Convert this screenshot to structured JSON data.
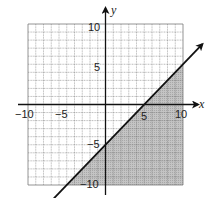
{
  "chart_data": {
    "type": "line",
    "title": "",
    "xlabel": "x",
    "ylabel": "y",
    "xlim": [
      -10,
      10
    ],
    "ylim": [
      -10,
      10
    ],
    "grid": true,
    "grid_step": 1,
    "x_tick_labels": [
      "-10",
      "-5",
      "5",
      "10"
    ],
    "x_ticks": [
      -10,
      -5,
      5,
      10
    ],
    "y_tick_labels": [
      "10",
      "5",
      "-5",
      "-10"
    ],
    "y_ticks": [
      10,
      5,
      -5,
      -10
    ],
    "series": [
      {
        "name": "boundary",
        "equation": "y = x - 5",
        "style": "solid",
        "arrows": "both",
        "x": [
          -7.5,
          0,
          5,
          12.5
        ],
        "y": [
          -12.5,
          -5,
          0,
          7.5
        ]
      }
    ],
    "shaded_region": {
      "inequality": "y <= x - 5",
      "side": "below",
      "color": "#b8b8b8"
    },
    "legend": null
  },
  "colors": {
    "grid": "#7a7a7a",
    "axis": "#111111",
    "line": "#111111",
    "shade": "#b8b8b8",
    "background": "#ffffff"
  },
  "labels": {
    "x_axis": "x",
    "y_axis": "y",
    "x_neg10": "−10",
    "x_neg5": "−5",
    "x_5": "5",
    "x_10": "10",
    "y_10": "10",
    "y_5": "5",
    "y_neg5": "−5",
    "y_neg10": "−10"
  }
}
